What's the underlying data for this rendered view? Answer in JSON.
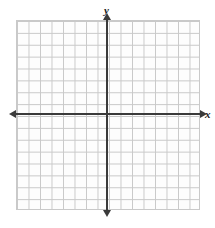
{
  "figure": {
    "name": "blank-coordinate-plane",
    "width": 215,
    "height": 228,
    "background_color": "#ffffff"
  },
  "grid": {
    "line_color": "#c9c9c9",
    "cell_fill_color": "#fdfdfd",
    "columns": 16,
    "rows": 16,
    "cell_width": 11.5,
    "cell_height": 11.875,
    "left": 16,
    "top": 20,
    "width": 184,
    "height": 190,
    "show_border": true
  },
  "axes": {
    "color": "#3a3a3a",
    "thickness": 2,
    "origin": {
      "x": 107,
      "y": 114
    },
    "x_axis": {
      "label": "x",
      "start_x": 16,
      "end_x": 200,
      "y": 114,
      "arrow_start": "left",
      "arrow_end": "right"
    },
    "y_axis": {
      "label": "y",
      "start_y": 20,
      "end_y": 210,
      "x": 107,
      "arrow_start": "up",
      "arrow_end": "down"
    },
    "tick_labels": [],
    "has_number_labels": false
  },
  "labels": {
    "y_label": "y",
    "y_label_x": 104,
    "y_label_y": 5,
    "x_label": "x",
    "x_label_x": 205,
    "x_label_y": 109
  },
  "chart_data": {
    "type": "scatter",
    "title": "",
    "xlabel": "x",
    "ylabel": "y",
    "series": [],
    "x": [],
    "values": [],
    "xlim": [
      -8,
      8
    ],
    "ylim": [
      -8,
      8
    ],
    "grid": true,
    "legend": false
  }
}
